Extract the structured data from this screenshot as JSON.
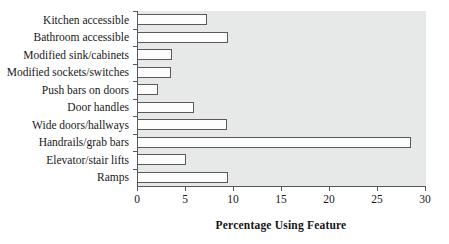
{
  "chart_data": {
    "type": "bar",
    "orientation": "horizontal",
    "title": "",
    "xlabel": "Percentage Using Feature",
    "ylabel": "",
    "xlim": [
      0,
      30
    ],
    "xticks": [
      0,
      5,
      10,
      15,
      20,
      25,
      30
    ],
    "grid": false,
    "legend": null,
    "categories": [
      "Kitchen accessible",
      "Bathroom accessible",
      "Modified sink/cabinets",
      "Modified sockets/switches",
      "Push bars on doors",
      "Door handles",
      "Wide doors/hallways",
      "Handrails/grab bars",
      "Elevator/stair lifts",
      "Ramps"
    ],
    "values": [
      7.3,
      9.5,
      3.6,
      3.5,
      2.2,
      5.9,
      9.4,
      28.5,
      5.1,
      9.5
    ],
    "bar_fill": "#fdfdfd",
    "bar_edge": "#5a5a5c",
    "plot_background": "#e7e8e8",
    "axis_color": "#58585a",
    "figure_background": "#ffffff"
  }
}
